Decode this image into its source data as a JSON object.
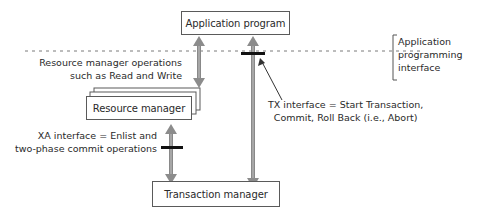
{
  "diagram": {
    "type": "architecture",
    "nodes": {
      "application_program": "Application program",
      "resource_manager": "Resource manager",
      "transaction_manager": "Transaction manager"
    },
    "labels": {
      "rm_ops_line1": "Resource manager operations",
      "rm_ops_line2": "such as Read and Write",
      "xa_line1": "XA interface = Enlist and",
      "xa_line2": "two-phase commit operations",
      "tx_line1": "TX interface = Start Transaction,",
      "tx_line2": "Commit, Roll Back (i.e., Abort)",
      "api_line1": "Application",
      "api_line2": "programming",
      "api_line3": "interface"
    },
    "edges": [
      {
        "from": "application_program",
        "to": "resource_manager",
        "label": "Resource manager operations such as Read and Write",
        "bidirectional": true
      },
      {
        "from": "application_program",
        "to": "transaction_manager",
        "label": "TX interface = Start Transaction, Commit, Roll Back (i.e., Abort)",
        "bidirectional": true
      },
      {
        "from": "resource_manager",
        "to": "transaction_manager",
        "label": "XA interface = Enlist and two-phase commit operations",
        "bidirectional": true
      }
    ],
    "colors": {
      "arrow": "#8c8c8c",
      "border": "#5a5a5a",
      "marker": "#111111"
    }
  }
}
